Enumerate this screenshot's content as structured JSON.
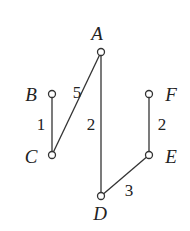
{
  "diagram": {
    "type": "weighted-graph",
    "nodes": [
      {
        "id": "A",
        "label": "A",
        "x": 101,
        "y": 52,
        "lx": 97,
        "ly": 40
      },
      {
        "id": "B",
        "label": "B",
        "x": 52,
        "y": 94,
        "lx": 31,
        "ly": 101
      },
      {
        "id": "C",
        "label": "C",
        "x": 52,
        "y": 155,
        "lx": 31,
        "ly": 163
      },
      {
        "id": "D",
        "label": "D",
        "x": 101,
        "y": 196,
        "lx": 100,
        "ly": 220
      },
      {
        "id": "E",
        "label": "E",
        "x": 149,
        "y": 155,
        "lx": 171,
        "ly": 163
      },
      {
        "id": "F",
        "label": "F",
        "x": 149,
        "y": 94,
        "lx": 171,
        "ly": 101
      }
    ],
    "edges": [
      {
        "from": "B",
        "to": "C",
        "weight": "1",
        "wx": 41,
        "wy": 130
      },
      {
        "from": "A",
        "to": "C",
        "weight": "5",
        "wx": 77,
        "wy": 98
      },
      {
        "from": "A",
        "to": "D",
        "weight": "2",
        "wx": 91,
        "wy": 130
      },
      {
        "from": "F",
        "to": "E",
        "weight": "2",
        "wx": 162,
        "wy": 130
      },
      {
        "from": "D",
        "to": "E",
        "weight": "3",
        "wx": 129,
        "wy": 196
      }
    ]
  }
}
